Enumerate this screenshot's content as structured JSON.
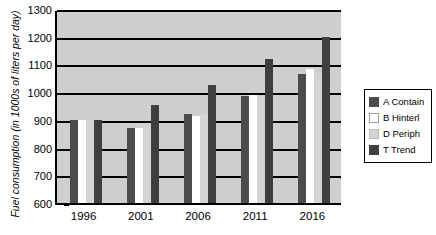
{
  "chart_data": {
    "type": "bar",
    "title": "",
    "xlabel": "",
    "ylabel": "Fuel consumption (in 1000s of liters per day)",
    "categories": [
      "1996",
      "2001",
      "2006",
      "2011",
      "2016"
    ],
    "ylim": [
      600,
      1300
    ],
    "yticks": [
      600,
      700,
      800,
      900,
      1000,
      1100,
      1200,
      1300
    ],
    "grid": true,
    "legend_position": "right",
    "series": [
      {
        "name": "A Contain",
        "color": "#4c4c4c",
        "values": [
          900,
          872,
          920,
          985,
          1065
        ]
      },
      {
        "name": "B Hinterl",
        "color": "#ffffff",
        "values": [
          900,
          872,
          915,
          990,
          1085
        ]
      },
      {
        "name": "D Periph",
        "color": "#d4d4d4",
        "values": [
          900,
          880,
          920,
          985,
          1070
        ]
      },
      {
        "name": "T Trend",
        "color": "#3f3f3f",
        "values": [
          900,
          955,
          1025,
          1120,
          1200
        ]
      }
    ]
  },
  "axis": {
    "y_title": "Fuel consumption (in 1000s of liters per day)",
    "y_tick_labels": [
      "1300",
      "1200",
      "1100",
      "1000",
      "900",
      "800",
      "700",
      "600"
    ],
    "x_tick_labels": [
      "1996",
      "2001",
      "2006",
      "2011",
      "2016"
    ]
  },
  "legend": {
    "items": [
      {
        "label": "A Contain",
        "color": "#4c4c4c"
      },
      {
        "label": "B Hinterl",
        "color": "#ffffff"
      },
      {
        "label": "D Periph",
        "color": "#d4d4d4"
      },
      {
        "label": "T Trend",
        "color": "#3f3f3f"
      }
    ]
  },
  "colors": {
    "plot_background": "#cfcfcf",
    "axis": "#000000",
    "page_background": "#ffffff"
  }
}
